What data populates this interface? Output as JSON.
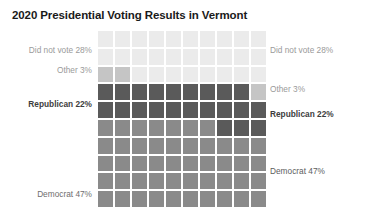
{
  "title": "2020 Presidential Voting Results in Vermont",
  "labels_left": [
    {
      "id": "didnotvote",
      "text": "Did not vote 28%",
      "style": "muted"
    },
    {
      "id": "other",
      "text": "Other 3%",
      "style": "muted"
    },
    {
      "id": "republican",
      "text": "Republican 22%",
      "style": "dark"
    },
    {
      "id": "democrat",
      "text": "Democrat 47%",
      "style": "mid"
    }
  ],
  "labels_right": [
    {
      "id": "didnotvote",
      "text": "Did not vote 28%",
      "style": "muted"
    },
    {
      "id": "other",
      "text": "Other 3%",
      "style": "muted"
    },
    {
      "id": "republican",
      "text": "Republican 22%",
      "style": "dark"
    },
    {
      "id": "democrat",
      "text": "Democrat 47%",
      "style": "demo"
    }
  ],
  "chart_data": {
    "type": "waffle",
    "title": "2020 Presidential Voting Results in Vermont",
    "xlabel": "",
    "ylabel": "",
    "grid_rows": 10,
    "grid_cols": 10,
    "total_cells": 100,
    "fill_order": "bottom-left-to-top-right, row-major from bottom",
    "categories": [
      "Democrat",
      "Republican",
      "Other",
      "Did not vote"
    ],
    "values": [
      47,
      22,
      3,
      28
    ],
    "value_unit": "percent",
    "colors": [
      "#8a8a8a",
      "#5a5a5a",
      "#c5c5c5",
      "#ebebeb"
    ],
    "cell_border_color": "#ffffff",
    "background": "#ffffff",
    "legend": "inline side labels, left and right",
    "grid": false,
    "annotations": [
      "Did not vote 28%",
      "Other 3%",
      "Republican 22%",
      "Democrat 47%"
    ]
  }
}
